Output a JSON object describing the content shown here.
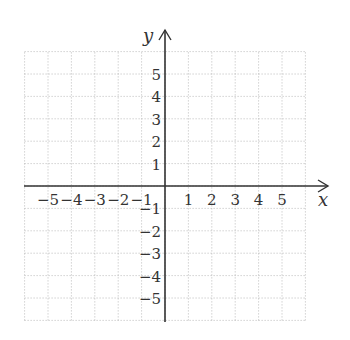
{
  "chart_data": {
    "type": "coordinate-plane",
    "title": "",
    "xlabel": "x",
    "ylabel": "y",
    "xlim": [
      -6,
      6
    ],
    "ylim": [
      -6,
      6
    ],
    "grid": true,
    "grid_style": "dotted",
    "x_ticks": [
      -5,
      -4,
      -3,
      -2,
      -1,
      1,
      2,
      3,
      4,
      5
    ],
    "y_ticks": [
      -5,
      -4,
      -3,
      -2,
      -1,
      1,
      2,
      3,
      4,
      5
    ],
    "x_tick_labels": [
      "−5",
      "−4",
      "−3",
      "−2",
      "−1",
      "1",
      "2",
      "3",
      "4",
      "5"
    ],
    "y_tick_labels": [
      "−5",
      "−4",
      "−3",
      "−2",
      "−1",
      "1",
      "2",
      "3",
      "4",
      "5"
    ],
    "series": []
  },
  "axes": {
    "x_label": "x",
    "y_label": "y",
    "color": "#333333",
    "grid_color": "#aaaaaa"
  }
}
